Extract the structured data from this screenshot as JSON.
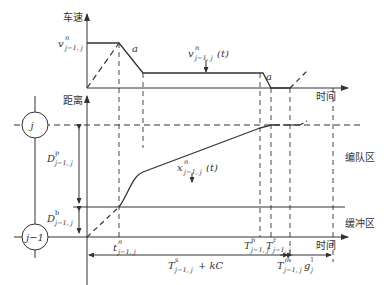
{
  "diagram": {
    "top_panel": {
      "y_axis_label": "车速",
      "x_axis_label": "时间",
      "speed_label": {
        "base": "v",
        "sup": "n",
        "sub": "j−1, j"
      },
      "speed_curve_label": {
        "base": "v",
        "sup": "n",
        "sub": "j−1, j",
        "arg": "(t)"
      },
      "decel_label_1": "a",
      "decel_label_2": "a"
    },
    "bottom_panel": {
      "y_axis_label": "距离",
      "x_axis_label": "时间",
      "node_upper": "j",
      "node_lower": "j−1",
      "zone_upper": "编队区",
      "zone_lower": "缓冲区",
      "position_curve_label": {
        "base": "x",
        "sup": "n",
        "sub": "j−1, j",
        "arg": "(t)"
      },
      "dist_platoon_label": {
        "base": "D",
        "sup": "p",
        "sub": "j−1, j"
      },
      "dist_buffer_label": {
        "base": "D",
        "sup": "b",
        "sub": "j−1, j"
      },
      "time_marks": [
        {
          "base": "t",
          "sup": "n",
          "sub": "j−1, j"
        },
        {
          "base": "T",
          "sup": "p",
          "sub": "j−1, j"
        },
        {
          "base": "T",
          "sup": "r",
          "sub": "j−1, j"
        },
        {
          "base": "T",
          "sup": "d",
          "sub": "j−1, j"
        }
      ],
      "interval_main": {
        "base": "T",
        "sup": "s",
        "sub": "j−1, j",
        "suffix": " + kC"
      },
      "interval_gap": {
        "base": "g",
        "sup": "l",
        "sub": "j"
      }
    },
    "colors": {
      "line": "#333333",
      "background": "#ffffff"
    }
  }
}
